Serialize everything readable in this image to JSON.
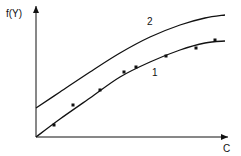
{
  "chart_data": {
    "type": "line",
    "title": "",
    "xlabel": "C",
    "ylabel": "f(Y)",
    "grid": false,
    "ticks": "none",
    "series": [
      {
        "name": "2",
        "style": "line",
        "points_px": [
          [
            36,
            108
          ],
          [
            60,
            92
          ],
          [
            90,
            72
          ],
          [
            120,
            53
          ],
          [
            150,
            37
          ],
          [
            180,
            25
          ],
          [
            205,
            18
          ],
          [
            225,
            15
          ]
        ]
      },
      {
        "name": "1",
        "style": "line",
        "points_px": [
          [
            36,
            137
          ],
          [
            60,
            119
          ],
          [
            90,
            98
          ],
          [
            120,
            77
          ],
          [
            150,
            62
          ],
          [
            180,
            50
          ],
          [
            205,
            43
          ],
          [
            225,
            41
          ]
        ]
      },
      {
        "name": "1 (measured points)",
        "style": "scatter",
        "points_px": [
          [
            54,
            125
          ],
          [
            73,
            105
          ],
          [
            100,
            90
          ],
          [
            124,
            72
          ],
          [
            136,
            67
          ],
          [
            166,
            56
          ],
          [
            196,
            48
          ],
          [
            215,
            40
          ]
        ]
      }
    ],
    "curve_labels": [
      {
        "text": "2",
        "x": 147,
        "y": 25
      },
      {
        "text": "1",
        "x": 152,
        "y": 76
      }
    ],
    "axes": {
      "origin_px": [
        36,
        137
      ],
      "x_end_px": 228,
      "y_end_px": 6
    }
  },
  "labels": {
    "y_axis": "f(Y)",
    "x_axis": "C",
    "curve_2": "2",
    "curve_1": "1"
  }
}
